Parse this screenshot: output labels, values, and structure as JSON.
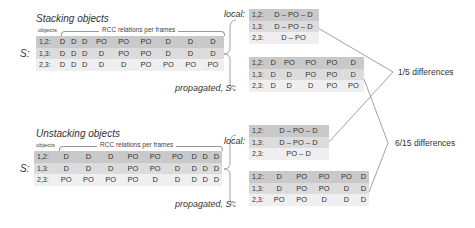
{
  "colors": {
    "row1": "#c9c9c9",
    "row2": "#dcdcdc",
    "row3": "#efefef",
    "line": "#888888"
  },
  "common": {
    "objects_label": "objects",
    "rcc_label": "RCC relations per frames",
    "s_label": "S:",
    "local_label": "local:",
    "propagated_label": "propagated, S':"
  },
  "stacking": {
    "title": "Stacking objects",
    "S": [
      {
        "pair": "1,2:",
        "values": [
          "D",
          "D",
          "D",
          "PO",
          "PO",
          "PO",
          "D",
          "D",
          "D"
        ]
      },
      {
        "pair": "1,3:",
        "values": [
          "D",
          "D",
          "D",
          "D",
          "PO",
          "PO",
          "D",
          "D",
          "D"
        ]
      },
      {
        "pair": "2,3:",
        "values": [
          "D",
          "D",
          "D",
          "D",
          "D",
          "PO",
          "PO",
          "PO",
          "PO"
        ]
      }
    ],
    "local": [
      {
        "pair": "1,2:",
        "value": "D – PO – D"
      },
      {
        "pair": "1,3:",
        "value": "D – PO – D"
      },
      {
        "pair": "2,3:",
        "value": "D – PO"
      }
    ],
    "propagated": [
      {
        "pair": "1,2:",
        "values": [
          "D",
          "PO",
          "PO",
          "PO",
          "D"
        ]
      },
      {
        "pair": "1,3:",
        "values": [
          "D",
          "D",
          "PO",
          "PO",
          "D"
        ]
      },
      {
        "pair": "2,3:",
        "values": [
          "D",
          "D",
          "D",
          "PO",
          "PO"
        ]
      }
    ]
  },
  "unstacking": {
    "title": "Unstacking objects",
    "S": [
      {
        "pair": "1,2:",
        "values": [
          "D",
          "D",
          "D",
          "PO",
          "PO",
          "PO",
          "D",
          "D",
          "D"
        ]
      },
      {
        "pair": "1,3:",
        "values": [
          "D",
          "D",
          "D",
          "PO",
          "PO",
          "D",
          "D",
          "D",
          "D"
        ]
      },
      {
        "pair": "2,3:",
        "values": [
          "PO",
          "PO",
          "PO",
          "PO",
          "D",
          "D",
          "D",
          "D",
          "D"
        ]
      }
    ],
    "local": [
      {
        "pair": "1,2:",
        "value": "D – PO – D"
      },
      {
        "pair": "1,3:",
        "value": "D – PO – D"
      },
      {
        "pair": "2,3:",
        "value": "PO – D"
      }
    ],
    "propagated": [
      {
        "pair": "1,2:",
        "values": [
          "D",
          "PO",
          "PO",
          "PO",
          "D"
        ]
      },
      {
        "pair": "1,3:",
        "values": [
          "D",
          "PO",
          "PO",
          "D",
          "D"
        ]
      },
      {
        "pair": "2,3:",
        "values": [
          "PO",
          "PO",
          "D",
          "D",
          "D"
        ]
      }
    ]
  },
  "differences": {
    "local": "1/5 differences",
    "propagated": "6/15 differences"
  }
}
